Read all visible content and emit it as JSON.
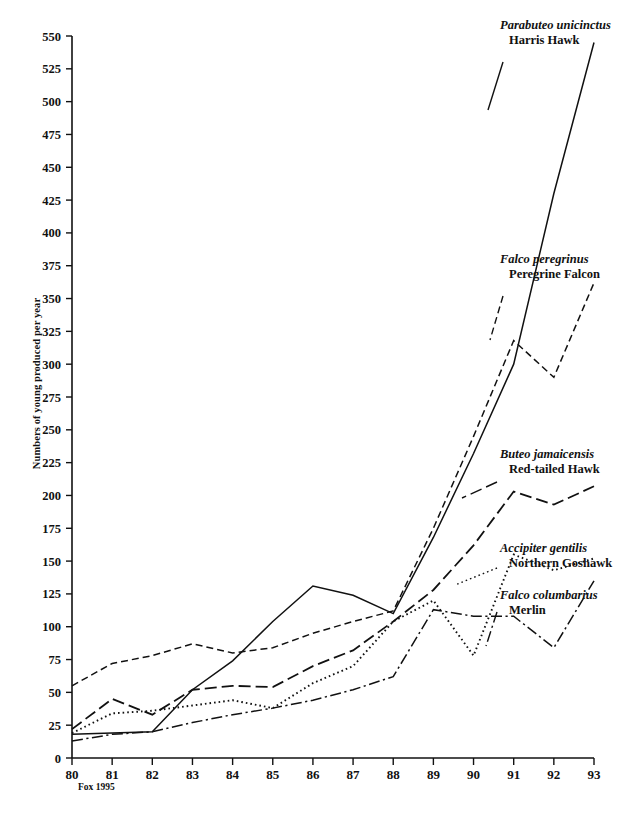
{
  "figure": {
    "source_note": "Fox 1995",
    "y_axis_title": "Numbers of young produced per year"
  },
  "chart_data": {
    "type": "line",
    "title": "",
    "xlabel": "",
    "ylabel": "Numbers of young produced per year",
    "xlim": [
      80,
      93
    ],
    "ylim": [
      0,
      550
    ],
    "ytick_step": 25,
    "grid": false,
    "legend_position": "right-inline-annotations",
    "x": [
      80,
      81,
      82,
      83,
      84,
      85,
      86,
      87,
      88,
      89,
      90,
      91,
      92,
      93
    ],
    "categories": [
      "80",
      "81",
      "82",
      "83",
      "84",
      "85",
      "86",
      "87",
      "88",
      "89",
      "90",
      "91",
      "92",
      "93"
    ],
    "yticks": [
      0,
      25,
      50,
      75,
      100,
      125,
      150,
      175,
      200,
      225,
      250,
      275,
      300,
      325,
      350,
      375,
      400,
      425,
      450,
      475,
      500,
      525,
      550
    ],
    "series": [
      {
        "name": "Harris Hawk",
        "scientific_name": "Parabuteo unicinctus",
        "line_style": "solid",
        "values": [
          18,
          19,
          20,
          52,
          74,
          104,
          131,
          124,
          110,
          168,
          232,
          300,
          430,
          545
        ]
      },
      {
        "name": "Peregrine Falcon",
        "scientific_name": "Falco peregrinus",
        "line_style": "dashed",
        "values": [
          55,
          72,
          78,
          87,
          80,
          84,
          95,
          104,
          112,
          175,
          245,
          318,
          290,
          362
        ]
      },
      {
        "name": "Red-tailed Hawk",
        "scientific_name": "Buteo jamaicensis",
        "line_style": "long-dash",
        "values": [
          22,
          45,
          33,
          52,
          55,
          54,
          70,
          82,
          104,
          128,
          162,
          203,
          193,
          207
        ]
      },
      {
        "name": "Northern Goshawk",
        "scientific_name": "Accipiter gentilis",
        "line_style": "dotted",
        "values": [
          19,
          34,
          36,
          40,
          44,
          38,
          57,
          70,
          104,
          120,
          78,
          155,
          143,
          152
        ]
      },
      {
        "name": "Merlin",
        "scientific_name": "Falco columbarius",
        "line_style": "dash-dot",
        "values": [
          13,
          18,
          20,
          27,
          33,
          38,
          44,
          52,
          62,
          113,
          108,
          108,
          84,
          135
        ]
      }
    ]
  },
  "series_labels": [
    {
      "sci": "Parabuteo unicinctus",
      "com": "Harris Hawk"
    },
    {
      "sci": "Falco peregrinus",
      "com": "Peregrine Falcon"
    },
    {
      "sci": "Buteo jamaicensis",
      "com": "Red-tailed Hawk"
    },
    {
      "sci": "Accipiter gentilis",
      "com": "Northern Goshawk"
    },
    {
      "sci": "Falco columbarius",
      "com": "Merlin"
    }
  ]
}
